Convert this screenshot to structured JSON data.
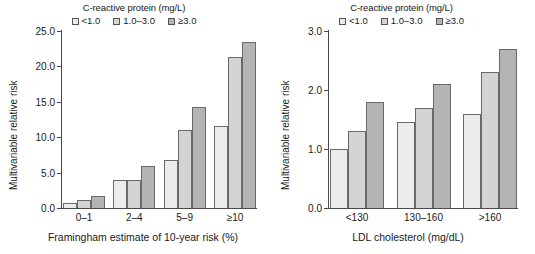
{
  "chart_data": [
    {
      "type": "bar",
      "panel": "left",
      "title": "",
      "legend_title": "C-reactive protein (mg/L)",
      "legend_position": "top-center",
      "grid": false,
      "categories": [
        "0–1",
        "2–4",
        "5–9",
        "≥10"
      ],
      "series": [
        {
          "name": "<1.0",
          "color": "#ececec",
          "values": [
            0.7,
            4.0,
            6.8,
            11.6
          ]
        },
        {
          "name": "1.0–3.0",
          "color": "#d4d4d4",
          "values": [
            1.1,
            4.0,
            11.0,
            21.3
          ]
        },
        {
          "name": "≥3.0",
          "color": "#b4b4b4",
          "values": [
            1.7,
            5.9,
            14.2,
            23.4
          ]
        }
      ],
      "xlabel": "Framingham estimate of 10-year risk (%)",
      "ylabel": "Multivariable relative risk",
      "ylim": [
        0.0,
        25.0
      ],
      "yticks": [
        "0.0",
        "5.0",
        "10.0",
        "15.0",
        "20.0",
        "25.0"
      ],
      "ytick_values": [
        0.0,
        5.0,
        10.0,
        15.0,
        20.0,
        25.0
      ]
    },
    {
      "type": "bar",
      "panel": "right",
      "title": "",
      "legend_title": "C-reactive protein (mg/L)",
      "legend_position": "top-center",
      "grid": false,
      "categories": [
        "<130",
        "130–160",
        ">160"
      ],
      "series": [
        {
          "name": "<1.0",
          "color": "#ececec",
          "values": [
            1.0,
            1.45,
            1.6
          ]
        },
        {
          "name": "1.0–3.0",
          "color": "#d4d4d4",
          "values": [
            1.3,
            1.7,
            2.3
          ]
        },
        {
          "name": "≥3.0",
          "color": "#b4b4b4",
          "values": [
            1.8,
            2.1,
            2.7
          ]
        }
      ],
      "xlabel": "LDL cholesterol (mg/dL)",
      "ylabel": "Multivariable relative risk",
      "ylim": [
        0.0,
        3.0
      ],
      "yticks": [
        "0.0",
        "1.0",
        "2.0",
        "3.0"
      ],
      "ytick_values": [
        0.0,
        1.0,
        2.0,
        3.0
      ]
    }
  ]
}
